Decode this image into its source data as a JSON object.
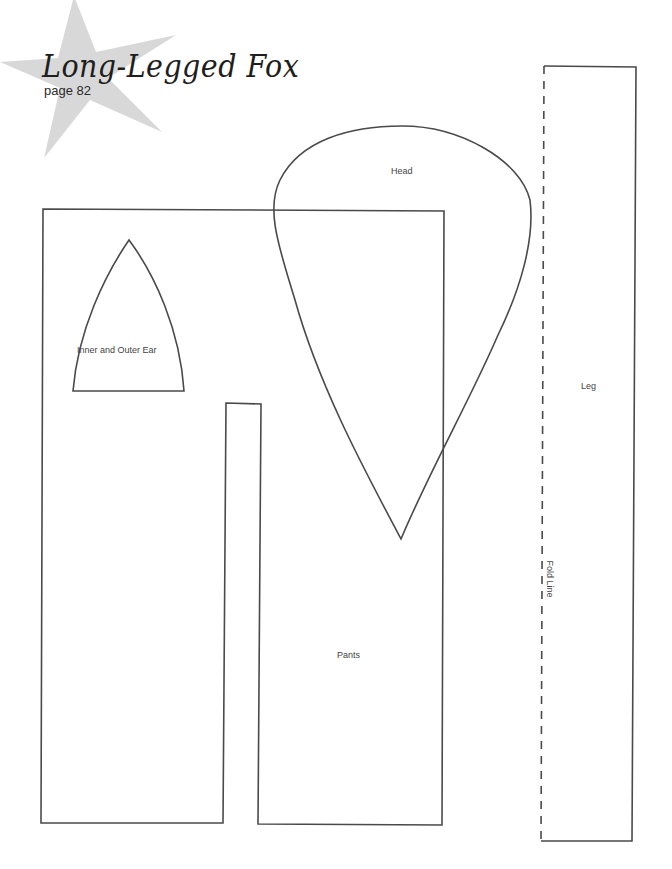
{
  "header": {
    "title": "Long-Legged Fox",
    "page_ref": "page 82"
  },
  "pattern_pieces": {
    "head": {
      "label": "Head"
    },
    "ear": {
      "label": "Inner and Outer Ear"
    },
    "leg": {
      "label": "Leg",
      "fold_label": "Fold Line"
    },
    "pants": {
      "label": "Pants"
    }
  },
  "colors": {
    "outline": "#4a4a4a",
    "star": "#d6d6d6",
    "background": "#ffffff"
  }
}
